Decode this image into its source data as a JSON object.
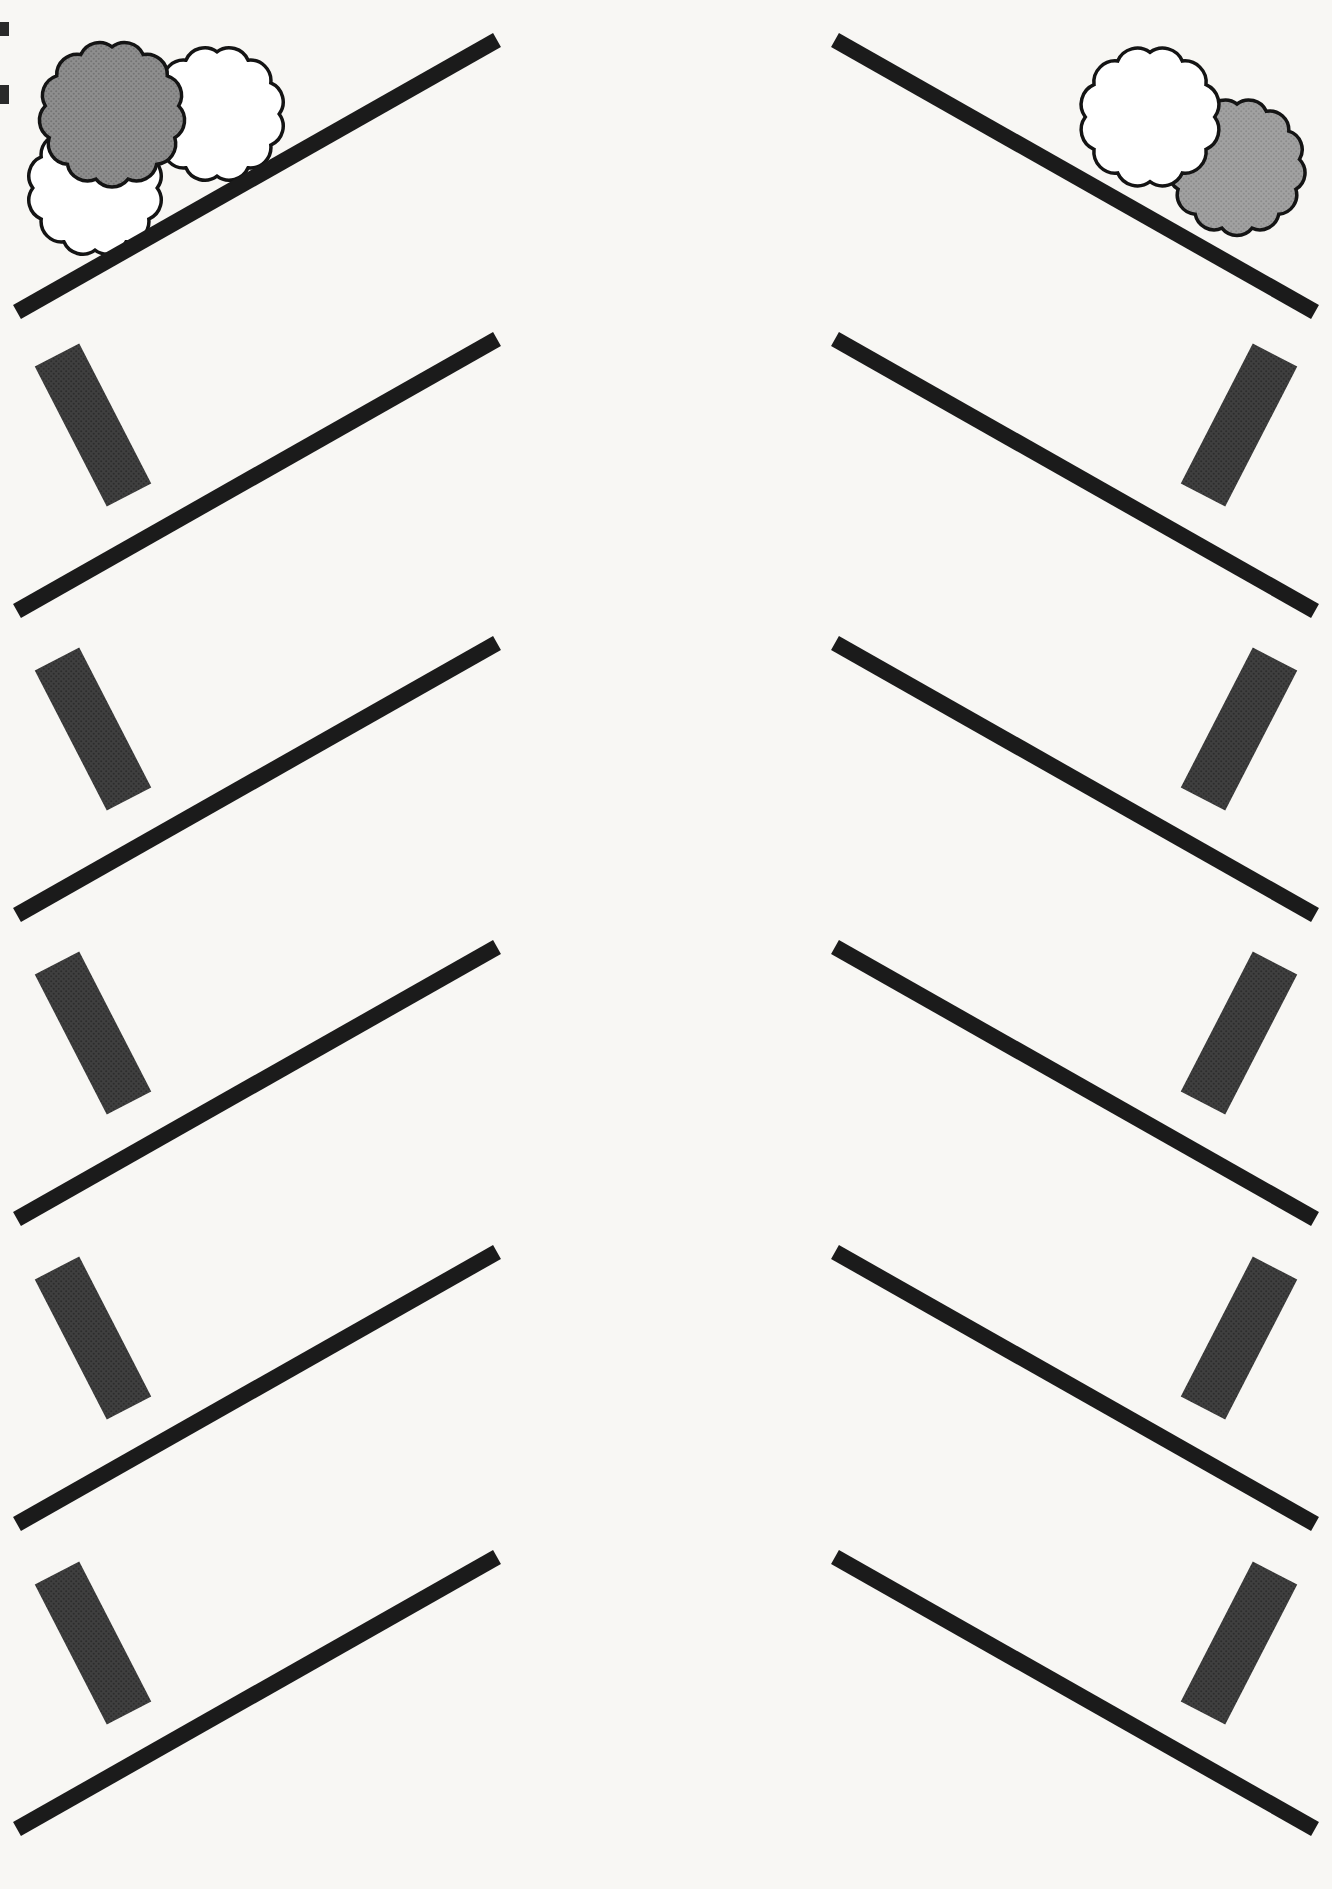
{
  "canvas": {
    "width": 1332,
    "height": 1889,
    "background": "#f8f7f4"
  },
  "styles": {
    "line_color": "#1b1b1b",
    "line_width": 16,
    "bar_width": 50,
    "bar_color": "#3f3f3f",
    "bar_dot": "#2d2d2d",
    "cloud_outline": "#141414",
    "cloud_outline_width": 3.5,
    "cloud_white": "#ffffff",
    "gray_left_base": "#8e8e8e",
    "gray_left_dot": "#747474",
    "gray_right_base": "#a1a1a1",
    "gray_right_dot": "#8c8c8c",
    "speck_color": "#2a2a2a"
  },
  "rows": [
    {
      "top_y": 40,
      "left_bar": false,
      "right_bar": false
    },
    {
      "top_y": 339,
      "left_bar": true,
      "right_bar": true
    },
    {
      "top_y": 643,
      "left_bar": true,
      "right_bar": true
    },
    {
      "top_y": 947,
      "left_bar": true,
      "right_bar": true
    },
    {
      "top_y": 1252,
      "left_bar": true,
      "right_bar": true
    },
    {
      "top_y": 1557,
      "left_bar": true,
      "right_bar": true
    }
  ],
  "geometry": {
    "line_drop": 272,
    "left_line": {
      "x_outer": 17,
      "x_inner": 497
    },
    "right_line": {
      "x_inner": 835,
      "x_outer": 1315
    },
    "bar_dy_top": 16,
    "bar_dy_bottom": 156,
    "left_bar": {
      "x_top": 57,
      "x_bottom": 129
    },
    "right_bar": {
      "x_top": 1275,
      "x_bottom": 1203
    }
  },
  "clouds": {
    "left": [
      {
        "name": "white-cloud-lower",
        "cx": 95,
        "cy": 188,
        "r": 74,
        "petals": 12,
        "fill": "white"
      },
      {
        "name": "white-cloud-upper",
        "cx": 217,
        "cy": 114,
        "r": 74,
        "petals": 12,
        "fill": "white"
      },
      {
        "name": "gray-cloud",
        "cx": 112,
        "cy": 114,
        "r": 80,
        "petals": 13,
        "fill": "gray_left"
      }
    ],
    "right": [
      {
        "name": "gray-cloud",
        "cx": 1237,
        "cy": 167,
        "r": 75,
        "petals": 13,
        "fill": "gray_right"
      },
      {
        "name": "white-cloud",
        "cx": 1150,
        "cy": 117,
        "r": 77,
        "petals": 12,
        "fill": "white"
      }
    ]
  },
  "scan_specks": [
    {
      "x": 0,
      "y": 22,
      "w": 9,
      "h": 14
    },
    {
      "x": 0,
      "y": 85,
      "w": 9,
      "h": 19
    }
  ]
}
